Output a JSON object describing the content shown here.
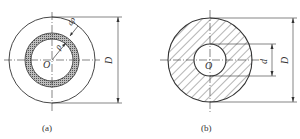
{
  "figure_a": {
    "caption": "(a)",
    "center_label": "O",
    "radius_label": "ρ",
    "thickness_label": "dρ",
    "outer_dim_label": "D"
  },
  "figure_b": {
    "caption": "(b)",
    "center_label": "O",
    "inner_dim_label": "d",
    "outer_dim_label": "D"
  },
  "colors": {
    "line": "#333333",
    "ring_fill": "#9a9a9a",
    "background": "#ffffff"
  }
}
